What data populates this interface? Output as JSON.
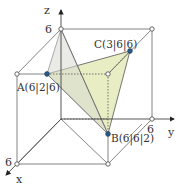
{
  "diagram": {
    "type": "3d-coordinate-cube",
    "axes": {
      "x": {
        "label": "x",
        "tick": "6"
      },
      "y": {
        "label": "y",
        "tick": "6"
      },
      "z": {
        "label": "z",
        "tick": "6"
      }
    },
    "points": {
      "A": {
        "label": "A(6|2|6)",
        "coords": [
          6,
          2,
          6
        ]
      },
      "B": {
        "label": "B(6|6|2)",
        "coords": [
          6,
          6,
          2
        ]
      },
      "C": {
        "label": "C(3|6|6)",
        "coords": [
          3,
          6,
          6
        ]
      }
    },
    "colors": {
      "line": "#555555",
      "triangle_fill": "#e6ebbe",
      "triangle_shadow": "#d9dcd6",
      "point": "#2a5a86",
      "vertex": "#ffffff"
    }
  }
}
